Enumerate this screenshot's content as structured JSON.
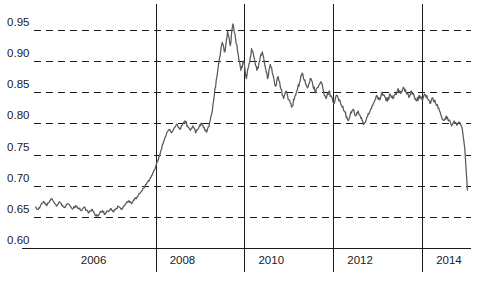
{
  "chart_data": {
    "type": "line",
    "title": "",
    "subtitle": "",
    "xlabel": "",
    "ylabel": "",
    "xlim": [
      2005.25,
      2015.1
    ],
    "ylim": [
      0.6,
      0.965
    ],
    "grid": true,
    "grid_axis": "y",
    "legend": "none",
    "line_color": "#555a5c",
    "axis_color": "#1a1a1a",
    "background_color": "#ffffff",
    "y_ticks": [
      0.6,
      0.65,
      0.7,
      0.75,
      0.8,
      0.85,
      0.9,
      0.95
    ],
    "y_tick_labels": [
      "0.60",
      "0.65",
      "0.70",
      "0.75",
      "0.80",
      "0.85",
      "0.90",
      "0.95"
    ],
    "x_ticks": [
      2006,
      2008,
      2010,
      2012,
      2014
    ],
    "x_tick_labels": [
      "2006",
      "2008",
      "2010",
      "2012",
      "2014"
    ],
    "vertical_rules": [
      2008,
      2010,
      2012,
      2014
    ],
    "series": [
      {
        "name": "rate",
        "x": [
          2005.3,
          2005.36,
          2005.42,
          2005.48,
          2005.54,
          2005.6,
          2005.66,
          2005.72,
          2005.78,
          2005.84,
          2005.9,
          2005.96,
          2006.02,
          2006.08,
          2006.14,
          2006.2,
          2006.26,
          2006.32,
          2006.38,
          2006.44,
          2006.5,
          2006.56,
          2006.62,
          2006.68,
          2006.74,
          2006.8,
          2006.86,
          2006.92,
          2006.98,
          2007.04,
          2007.1,
          2007.16,
          2007.22,
          2007.28,
          2007.34,
          2007.4,
          2007.46,
          2007.52,
          2007.58,
          2007.64,
          2007.7,
          2007.76,
          2007.82,
          2007.88,
          2007.94,
          2008.0,
          2008.06,
          2008.12,
          2008.18,
          2008.24,
          2008.3,
          2008.36,
          2008.42,
          2008.48,
          2008.54,
          2008.6,
          2008.66,
          2008.72,
          2008.78,
          2008.84,
          2008.9,
          2008.96,
          2009.02,
          2009.08,
          2009.14,
          2009.2,
          2009.26,
          2009.32,
          2009.38,
          2009.44,
          2009.5,
          2009.56,
          2009.62,
          2009.68,
          2009.74,
          2009.8,
          2009.86,
          2009.92,
          2009.98,
          2010.04,
          2010.1,
          2010.16,
          2010.22,
          2010.28,
          2010.34,
          2010.4,
          2010.46,
          2010.52,
          2010.58,
          2010.64,
          2010.7,
          2010.76,
          2010.82,
          2010.88,
          2010.94,
          2011.0,
          2011.06,
          2011.12,
          2011.18,
          2011.24,
          2011.3,
          2011.36,
          2011.42,
          2011.48,
          2011.54,
          2011.6,
          2011.66,
          2011.72,
          2011.78,
          2011.84,
          2011.9,
          2011.96,
          2012.02,
          2012.08,
          2012.14,
          2012.2,
          2012.26,
          2012.32,
          2012.38,
          2012.44,
          2012.5,
          2012.56,
          2012.62,
          2012.68,
          2012.74,
          2012.8,
          2012.86,
          2012.92,
          2012.98,
          2013.04,
          2013.1,
          2013.16,
          2013.22,
          2013.28,
          2013.34,
          2013.4,
          2013.46,
          2013.52,
          2013.58,
          2013.64,
          2013.7,
          2013.76,
          2013.82,
          2013.88,
          2013.94,
          2014.0,
          2014.06,
          2014.12,
          2014.18,
          2014.24,
          2014.3,
          2014.36,
          2014.42,
          2014.48,
          2014.54,
          2014.6,
          2014.66,
          2014.72,
          2014.78,
          2014.84,
          2014.9,
          2014.96,
          2015.02
        ],
        "y": [
          0.666,
          0.662,
          0.67,
          0.675,
          0.668,
          0.673,
          0.679,
          0.672,
          0.668,
          0.674,
          0.669,
          0.665,
          0.671,
          0.667,
          0.663,
          0.668,
          0.664,
          0.66,
          0.665,
          0.661,
          0.657,
          0.662,
          0.656,
          0.651,
          0.656,
          0.66,
          0.654,
          0.659,
          0.663,
          0.658,
          0.663,
          0.667,
          0.662,
          0.667,
          0.673,
          0.676,
          0.671,
          0.677,
          0.682,
          0.688,
          0.693,
          0.699,
          0.706,
          0.713,
          0.721,
          0.73,
          0.742,
          0.757,
          0.771,
          0.782,
          0.79,
          0.785,
          0.793,
          0.799,
          0.791,
          0.797,
          0.804,
          0.796,
          0.789,
          0.796,
          0.785,
          0.792,
          0.8,
          0.793,
          0.786,
          0.795,
          0.815,
          0.845,
          0.875,
          0.905,
          0.93,
          0.915,
          0.948,
          0.925,
          0.96,
          0.935,
          0.91,
          0.885,
          0.9,
          0.872,
          0.895,
          0.92,
          0.905,
          0.885,
          0.9,
          0.915,
          0.893,
          0.872,
          0.895,
          0.878,
          0.86,
          0.875,
          0.855,
          0.84,
          0.852,
          0.838,
          0.826,
          0.838,
          0.852,
          0.866,
          0.881,
          0.87,
          0.857,
          0.872,
          0.861,
          0.849,
          0.858,
          0.867,
          0.852,
          0.84,
          0.851,
          0.843,
          0.832,
          0.845,
          0.838,
          0.826,
          0.818,
          0.806,
          0.814,
          0.822,
          0.812,
          0.82,
          0.808,
          0.798,
          0.806,
          0.815,
          0.824,
          0.834,
          0.845,
          0.838,
          0.85,
          0.843,
          0.836,
          0.847,
          0.84,
          0.848,
          0.856,
          0.848,
          0.858,
          0.85,
          0.842,
          0.852,
          0.844,
          0.836,
          0.845,
          0.838,
          0.847,
          0.84,
          0.832,
          0.841,
          0.833,
          0.824,
          0.814,
          0.805,
          0.812,
          0.804,
          0.796,
          0.804,
          0.797,
          0.802,
          0.793,
          0.76,
          0.693
        ]
      }
    ]
  }
}
